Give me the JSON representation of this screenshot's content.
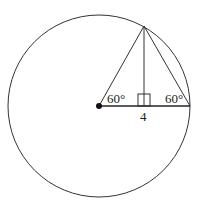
{
  "diagram": {
    "type": "geometry",
    "circle": {
      "cx": 99,
      "cy": 106,
      "r": 91,
      "stroke": "#333333"
    },
    "center_point": {
      "x": 99,
      "y": 106
    },
    "apex": {
      "x": 144,
      "y": 26
    },
    "right_point": {
      "x": 190,
      "y": 106
    },
    "foot": {
      "x": 144,
      "y": 106
    },
    "labels": {
      "left_angle": "60°",
      "right_angle": "60°",
      "segment": "4"
    }
  }
}
